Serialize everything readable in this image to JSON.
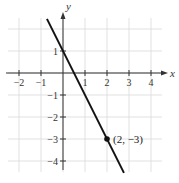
{
  "chart_data": {
    "type": "line",
    "title": "",
    "xlabel": "x",
    "ylabel": "y",
    "xlim": [
      -2.5,
      4.5
    ],
    "ylim": [
      -4.5,
      2.5
    ],
    "grid": true,
    "x_ticks": [
      -2,
      -1,
      1,
      2,
      3,
      4
    ],
    "y_ticks": [
      1,
      -1,
      -2,
      -3,
      -4
    ],
    "x_tick_labels": [
      "−2",
      "−1",
      "1",
      "2",
      "3",
      "4"
    ],
    "y_tick_labels": [
      "1",
      "−1",
      "−2",
      "−3",
      "−4"
    ],
    "series": [
      {
        "name": "y = -2x + 1",
        "x": [
          -0.73,
          2.77
        ],
        "y": [
          2.46,
          -4.54
        ]
      }
    ],
    "points": [
      {
        "x": 2,
        "y": -3,
        "label": "(2, −3)"
      }
    ]
  },
  "colors": {
    "grid": "#d9d9d9",
    "axis": "#333333",
    "line": "#111111",
    "background": "#ffffff"
  }
}
